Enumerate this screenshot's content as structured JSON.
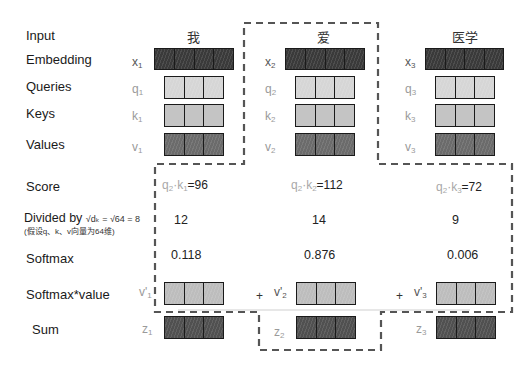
{
  "diagram": {
    "row_labels": {
      "input": "Input",
      "embedding": "Embedding",
      "queries": "Queries",
      "keys": "Keys",
      "values": "Values",
      "score": "Score",
      "divided": "Divided by",
      "divided_formula": "√dₖ = √64 = 8",
      "divided_note": "(假设q、k、v向量为64维)",
      "softmax": "Softmax",
      "softmax_value": "Softmax*value",
      "sum": "Sum"
    },
    "tokens": [
      {
        "word": "我",
        "x": "x",
        "x_sub": "1",
        "q": "q",
        "q_sub": "1",
        "k": "k",
        "k_sub": "1",
        "v": "v",
        "v_sub": "1",
        "score_q": "q",
        "score_q_sub": "2",
        "score_k": "k",
        "score_k_sub": "1",
        "score_value": "=96",
        "divided": "12",
        "softmax": "0.118",
        "wv": "v'",
        "wv_sub": "1",
        "z": "z",
        "z_sub": "1"
      },
      {
        "word": "爱",
        "x": "x",
        "x_sub": "2",
        "q": "q",
        "q_sub": "2",
        "k": "k",
        "k_sub": "2",
        "v": "v",
        "v_sub": "2",
        "score_q": "q",
        "score_q_sub": "2",
        "score_k": "k",
        "score_k_sub": "2",
        "score_value": "=112",
        "divided": "14",
        "softmax": "0.876",
        "wv": "v'",
        "wv_sub": "2",
        "z": "z",
        "z_sub": "2"
      },
      {
        "word": "医学",
        "x": "x",
        "x_sub": "3",
        "q": "q",
        "q_sub": "3",
        "k": "k",
        "k_sub": "3",
        "v": "v",
        "v_sub": "3",
        "score_q": "q",
        "score_q_sub": "2",
        "score_k": "k",
        "score_k_sub": "3",
        "score_value": "=72",
        "divided": "9",
        "softmax": "0.006",
        "wv": "v'",
        "wv_sub": "3",
        "z": "z",
        "z_sub": "3"
      }
    ],
    "plus_sign": "+",
    "score_dot": "·",
    "colors": {
      "embedding": "#3a3a3a",
      "query": "#d6d6d6",
      "key": "#c4c4c4",
      "value": "#6b6b6b",
      "weighted_value": "#bdbdbd",
      "sum": "#505050",
      "outline": "#555555"
    }
  }
}
